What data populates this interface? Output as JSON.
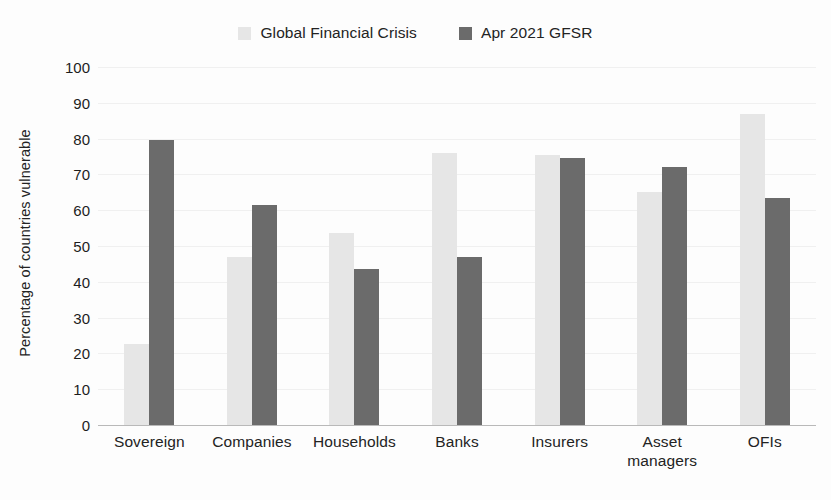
{
  "chart_data": {
    "type": "bar",
    "title": "",
    "xlabel": "",
    "ylabel": "Percentage of countries vulnerable",
    "ylim": [
      0,
      100
    ],
    "ytick_step": 10,
    "yticks": [
      "100",
      "90",
      "80",
      "70",
      "60",
      "50",
      "40",
      "30",
      "20",
      "10",
      "0"
    ],
    "grid": true,
    "legend_position": "top-center",
    "categories": [
      "Sovereign",
      "Companies",
      "Households",
      "Banks",
      "Insurers",
      "Asset managers",
      "OFIs"
    ],
    "category_lines": [
      [
        "Sovereign"
      ],
      [
        "Companies"
      ],
      [
        "Households"
      ],
      [
        "Banks"
      ],
      [
        "Insurers"
      ],
      [
        "Asset",
        "managers"
      ],
      [
        "OFIs"
      ]
    ],
    "series": [
      {
        "name": "Global Financial Crisis",
        "color": "#e6e6e6",
        "values": [
          22.5,
          47,
          53.5,
          76,
          75.5,
          65,
          87
        ]
      },
      {
        "name": "Apr 2021 GFSR",
        "color": "#6b6b6b",
        "values": [
          79.5,
          61.5,
          43.5,
          47,
          74.5,
          72,
          63.5
        ]
      }
    ]
  },
  "legend": {
    "entries": [
      {
        "label": "Global Financial Crisis",
        "color": "#e6e6e6"
      },
      {
        "label": "Apr 2021 GFSR",
        "color": "#6b6b6b"
      }
    ]
  },
  "axis": {
    "y_title": "Percentage of countries vulnerable"
  }
}
